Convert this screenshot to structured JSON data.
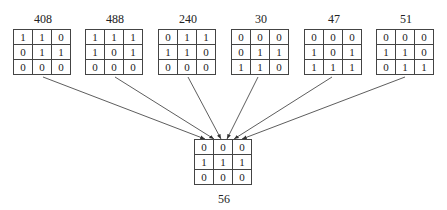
{
  "sources": [
    {
      "label": "408",
      "x": 13,
      "cells": [
        [
          "1",
          "1",
          "0"
        ],
        [
          "0",
          "1",
          "1"
        ],
        [
          "0",
          "0",
          "0"
        ]
      ]
    },
    {
      "label": "488",
      "x": 85,
      "cells": [
        [
          "1",
          "1",
          "1"
        ],
        [
          "1",
          "0",
          "1"
        ],
        [
          "0",
          "0",
          "0"
        ]
      ]
    },
    {
      "label": "240",
      "x": 158,
      "cells": [
        [
          "0",
          "1",
          "1"
        ],
        [
          "1",
          "1",
          "0"
        ],
        [
          "0",
          "0",
          "0"
        ]
      ]
    },
    {
      "label": "30",
      "x": 231,
      "cells": [
        [
          "0",
          "0",
          "0"
        ],
        [
          "0",
          "1",
          "1"
        ],
        [
          "1",
          "1",
          "0"
        ]
      ]
    },
    {
      "label": "47",
      "x": 304,
      "cells": [
        [
          "0",
          "0",
          "0"
        ],
        [
          "1",
          "0",
          "1"
        ],
        [
          "1",
          "1",
          "1"
        ]
      ]
    },
    {
      "label": "51",
      "x": 376,
      "cells": [
        [
          "0",
          "0",
          "0"
        ],
        [
          "1",
          "1",
          "0"
        ],
        [
          "0",
          "1",
          "1"
        ]
      ]
    }
  ],
  "target": {
    "label": "56",
    "cells": [
      [
        "0",
        "0",
        "0"
      ],
      [
        "1",
        "1",
        "1"
      ],
      [
        "0",
        "0",
        "0"
      ]
    ]
  }
}
